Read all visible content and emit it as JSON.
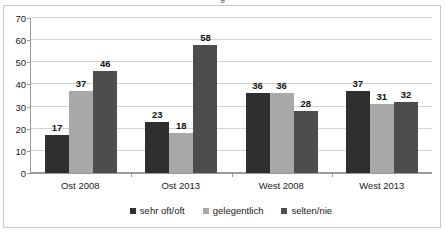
{
  "chart_data": {
    "type": "bar",
    "title": "",
    "xlabel": "",
    "ylabel": "",
    "ylim": [
      0,
      70
    ],
    "ytick_step": 10,
    "yticks": [
      0,
      10,
      20,
      30,
      40,
      50,
      60,
      70
    ],
    "grid": true,
    "legend_position": "bottom",
    "categories": [
      "Ost 2008",
      "Ost 2013",
      "West 2008",
      "West 2013"
    ],
    "series": [
      {
        "name": "sehr oft/oft",
        "color": "#2f2f2f",
        "values": [
          17,
          23,
          36,
          37
        ]
      },
      {
        "name": "gelegentlich",
        "color": "#a8a8a8",
        "values": [
          37,
          18,
          36,
          31
        ]
      },
      {
        "name": "selten/nie",
        "color": "#4d4d4d",
        "values": [
          46,
          58,
          28,
          32
        ]
      }
    ]
  },
  "title_remnant": "g"
}
